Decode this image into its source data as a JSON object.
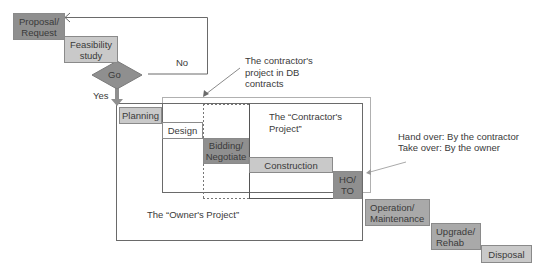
{
  "phases": {
    "proposal": "Proposal/\nRequest",
    "feasibility": "Feasibility\nstudy",
    "go": "Go",
    "planning": "Planning",
    "design": "Design",
    "bidding": "Bidding/\nNegotiate",
    "construction": "Construction",
    "hoto": "HO/\nTO",
    "operation": "Operation/\nMaintenance",
    "upgrade": "Upgrade/\nRehab",
    "disposal": "Disposal"
  },
  "labels": {
    "no": "No",
    "yes": "Yes",
    "db_contracts": "The contractor's\nproject in DB\ncontracts",
    "contractors_project": "The “Contractor's\nProject”",
    "owners_project": "The “Owner's Project”",
    "hand_over": "Hand over: By the contractor",
    "take_over": "Take over: By the owner"
  },
  "colors": {
    "dark": "#8f8f8f",
    "mid": "#a9a9a9",
    "light": "#c9c9c9",
    "line": "#6a6a6a"
  }
}
